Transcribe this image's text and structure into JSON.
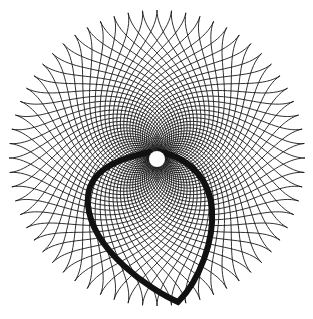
{
  "artwork": {
    "kind": "spiral-mesh-rosette",
    "width": 313,
    "height": 319,
    "background": "#ffffff",
    "stroke_color": "#1a1a1a",
    "center": {
      "x": 157,
      "y": 158
    },
    "outer_radius": 148,
    "inner_radius": 4,
    "spoke_count": 64,
    "twist": 2.2,
    "spoke_stroke_width": 0.9,
    "center_hole": {
      "x": 157,
      "y": 159,
      "r": 8,
      "color": "#ffffff"
    },
    "loop": {
      "color": "#111111",
      "stroke_width": 6,
      "path": "M150,152 C110,160 85,175 88,205 C92,250 150,290 178,302 C200,280 214,240 212,210 C210,180 190,158 160,152"
    }
  }
}
